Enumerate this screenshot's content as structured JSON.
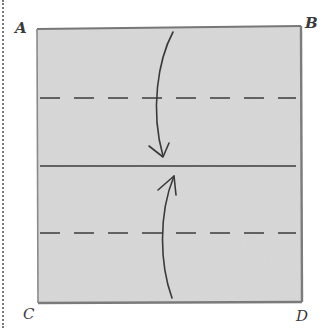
{
  "diagram": {
    "type": "origami-fold-instruction",
    "corners": {
      "top_left": "A",
      "top_right": "B",
      "bottom_left": "C",
      "bottom_right": "D"
    },
    "paper": {
      "fill_color": "#d6d6d6",
      "edge_color": "#6e6e6e"
    },
    "lines": [
      {
        "kind": "valley-fold-dashed",
        "position": "upper-quarter"
      },
      {
        "kind": "center-crease-solid",
        "position": "middle"
      },
      {
        "kind": "valley-fold-dashed",
        "position": "lower-quarter"
      }
    ],
    "arrows": [
      {
        "direction": "down",
        "meaning": "fold top edge to center"
      },
      {
        "direction": "up",
        "meaning": "fold bottom edge to center"
      }
    ],
    "line_color": "#3c3c3c"
  }
}
